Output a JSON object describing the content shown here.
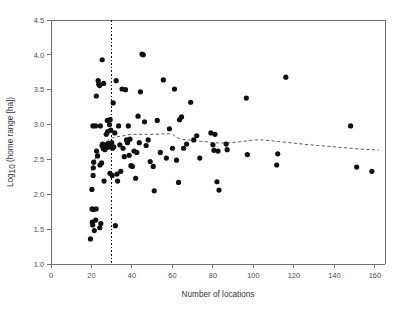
{
  "chart_data": {
    "type": "scatter",
    "title": "",
    "xlabel": "Number of locations",
    "ylabel": "Log10 (home range [ha])",
    "ylabel_base": "Log",
    "ylabel_sub": "10",
    "ylabel_rest": " (home range [ha])",
    "xlim": [
      0,
      165
    ],
    "ylim": [
      1.0,
      4.5
    ],
    "xticks": [
      0,
      20,
      40,
      60,
      80,
      100,
      120,
      140,
      160
    ],
    "xtick_labels": [
      "0",
      "20",
      "40",
      "60",
      "80",
      "100",
      "120",
      "140",
      "160"
    ],
    "yticks": [
      1.0,
      1.5,
      2.0,
      2.5,
      3.0,
      3.5,
      4.0,
      4.5
    ],
    "ytick_labels": [
      "1.0",
      "1.5",
      "2.0",
      "2.5",
      "3.0",
      "3.5",
      "4.0",
      "4.5"
    ],
    "grid": false,
    "legend": false,
    "point_color": "#101010",
    "point_radius": 2.6,
    "axis_color": "#6f6f6f",
    "annotations": [
      {
        "name": "threshold-line",
        "type": "vertical-dashed-line",
        "x": 30,
        "label": ""
      }
    ],
    "series": [
      {
        "name": "home range observations",
        "points": [
          [
            19.5,
            1.36
          ],
          [
            20.2,
            2.07
          ],
          [
            20.4,
            1.6
          ],
          [
            20.6,
            1.56
          ],
          [
            20.3,
            1.79
          ],
          [
            21.0,
            1.78
          ],
          [
            20.8,
            2.27
          ],
          [
            20.9,
            2.38
          ],
          [
            21.1,
            2.46
          ],
          [
            20.7,
            2.98
          ],
          [
            21.4,
            1.48
          ],
          [
            22.1,
            1.63
          ],
          [
            22.3,
            1.79
          ],
          [
            22.5,
            2.62
          ],
          [
            22.0,
            2.98
          ],
          [
            22.4,
            3.41
          ],
          [
            23.0,
            2.55
          ],
          [
            23.3,
            3.63
          ],
          [
            23.6,
            3.58
          ],
          [
            24.0,
            3.56
          ],
          [
            24.2,
            2.42
          ],
          [
            24.4,
            2.98
          ],
          [
            24.1,
            1.52
          ],
          [
            24.6,
            1.58
          ],
          [
            25.0,
            2.45
          ],
          [
            25.2,
            2.7
          ],
          [
            25.5,
            2.72
          ],
          [
            25.3,
            3.93
          ],
          [
            25.8,
            2.66
          ],
          [
            26.0,
            3.59
          ],
          [
            26.4,
            2.69
          ],
          [
            26.6,
            2.64
          ],
          [
            26.2,
            2.19
          ],
          [
            27.0,
            2.71
          ],
          [
            27.3,
            2.86
          ],
          [
            27.5,
            2.67
          ],
          [
            27.8,
            3.06
          ],
          [
            28.0,
            2.9
          ],
          [
            28.3,
            2.73
          ],
          [
            28.6,
            2.68
          ],
          [
            28.9,
            3.0
          ],
          [
            29.2,
            3.07
          ],
          [
            29.5,
            2.92
          ],
          [
            29.8,
            2.69
          ],
          [
            29.1,
            2.3
          ],
          [
            30.0,
            2.74
          ],
          [
            30.4,
            2.66
          ],
          [
            30.7,
            3.31
          ],
          [
            30.2,
            2.27
          ],
          [
            31.0,
            2.68
          ],
          [
            31.5,
            2.88
          ],
          [
            31.8,
            1.55
          ],
          [
            32.2,
            3.63
          ],
          [
            32.6,
            2.29
          ],
          [
            32.9,
            2.19
          ],
          [
            33.4,
            2.98
          ],
          [
            34.0,
            2.71
          ],
          [
            34.5,
            2.33
          ],
          [
            35.1,
            3.51
          ],
          [
            35.6,
            2.66
          ],
          [
            36.2,
            2.54
          ],
          [
            36.8,
            3.5
          ],
          [
            37.3,
            2.78
          ],
          [
            37.8,
            2.74
          ],
          [
            38.2,
            2.98
          ],
          [
            38.6,
            2.56
          ],
          [
            39.0,
            2.79
          ],
          [
            39.5,
            2.41
          ],
          [
            40.2,
            2.4
          ],
          [
            41.0,
            2.62
          ],
          [
            41.8,
            2.23
          ],
          [
            42.4,
            2.6
          ],
          [
            43.0,
            3.12
          ],
          [
            43.6,
            2.74
          ],
          [
            44.2,
            3.47
          ],
          [
            45.0,
            4.01
          ],
          [
            45.6,
            4.0
          ],
          [
            46.2,
            3.04
          ],
          [
            47.0,
            2.7
          ],
          [
            48.0,
            2.78
          ],
          [
            49.0,
            2.47
          ],
          [
            50.5,
            2.4
          ],
          [
            51.0,
            2.05
          ],
          [
            52.5,
            3.06
          ],
          [
            54.0,
            2.6
          ],
          [
            55.5,
            3.64
          ],
          [
            57.0,
            2.52
          ],
          [
            58.5,
            2.94
          ],
          [
            60.0,
            2.66
          ],
          [
            61.0,
            3.51
          ],
          [
            62.0,
            2.49
          ],
          [
            63.0,
            2.17
          ],
          [
            63.5,
            3.07
          ],
          [
            64.5,
            3.11
          ],
          [
            65.5,
            2.66
          ],
          [
            67.0,
            2.72
          ],
          [
            69.0,
            3.32
          ],
          [
            70.5,
            2.78
          ],
          [
            72.0,
            2.84
          ],
          [
            73.5,
            2.52
          ],
          [
            79.0,
            2.88
          ],
          [
            80.0,
            2.71
          ],
          [
            80.5,
            2.63
          ],
          [
            81.0,
            2.86
          ],
          [
            82.0,
            2.18
          ],
          [
            82.5,
            2.62
          ],
          [
            83.0,
            2.06
          ],
          [
            86.5,
            2.72
          ],
          [
            87.0,
            2.64
          ],
          [
            96.5,
            3.38
          ],
          [
            97.0,
            2.57
          ],
          [
            111.5,
            2.42
          ],
          [
            112.0,
            2.58
          ],
          [
            116.0,
            3.68
          ],
          [
            148.0,
            2.98
          ],
          [
            151.0,
            2.39
          ],
          [
            158.5,
            2.33
          ]
        ]
      }
    ],
    "trend": {
      "name": "running-mean-trend",
      "style": "dashed",
      "points": [
        [
          20.0,
          2.34
        ],
        [
          21.0,
          2.44
        ],
        [
          22.0,
          2.52
        ],
        [
          23.5,
          2.58
        ],
        [
          25.0,
          2.63
        ],
        [
          26.0,
          2.66
        ],
        [
          27.0,
          2.71
        ],
        [
          28.0,
          2.77
        ],
        [
          29.0,
          2.8
        ],
        [
          30.5,
          2.81
        ],
        [
          32.0,
          2.82
        ],
        [
          34.0,
          2.83
        ],
        [
          36.0,
          2.84
        ],
        [
          38.0,
          2.855
        ],
        [
          41.0,
          2.86
        ],
        [
          45.0,
          2.86
        ],
        [
          50.0,
          2.86
        ],
        [
          55.0,
          2.865
        ],
        [
          58.0,
          2.87
        ],
        [
          60.0,
          2.86
        ],
        [
          62.0,
          2.82
        ],
        [
          64.0,
          2.79
        ],
        [
          68.0,
          2.78
        ],
        [
          72.0,
          2.765
        ],
        [
          76.0,
          2.755
        ],
        [
          80.0,
          2.74
        ],
        [
          84.0,
          2.735
        ],
        [
          88.0,
          2.74
        ],
        [
          94.0,
          2.755
        ],
        [
          100.0,
          2.78
        ],
        [
          104.0,
          2.78
        ],
        [
          110.0,
          2.765
        ],
        [
          118.0,
          2.74
        ],
        [
          126.0,
          2.715
        ],
        [
          134.0,
          2.695
        ],
        [
          142.0,
          2.675
        ],
        [
          150.0,
          2.655
        ],
        [
          158.0,
          2.64
        ],
        [
          162.0,
          2.635
        ]
      ]
    }
  }
}
